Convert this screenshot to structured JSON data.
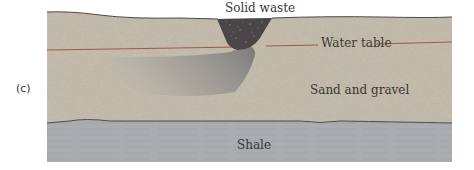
{
  "figure": {
    "panel_label": "(c)",
    "labels": {
      "solid_waste": "Solid waste",
      "water_table": "Water table",
      "sand_gravel": "Sand and gravel",
      "shale": "Shale"
    },
    "colors": {
      "sand": "#c9c1b1",
      "shale": "#a9adb1",
      "waste": "#4a4648",
      "plume": "#8e8f8f",
      "water_table_line": "#a0584a",
      "boundary_line": "#4e4b44"
    }
  }
}
